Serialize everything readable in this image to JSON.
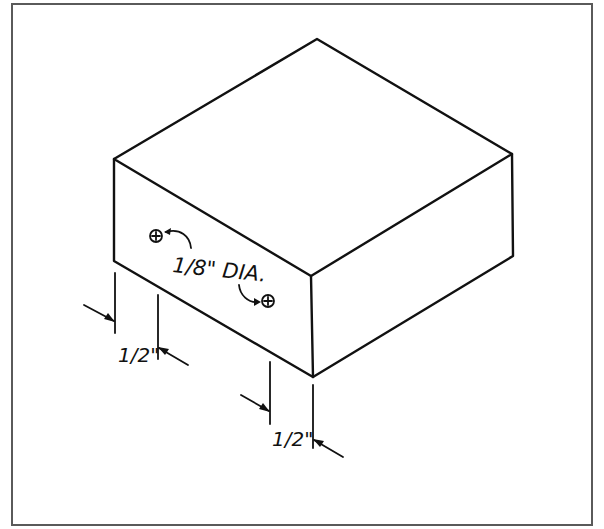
{
  "figure": {
    "type": "isometric-block-drawing",
    "frame_color": "#5a5a5a",
    "line_color": "#111111"
  },
  "annotations": {
    "hole_note": "1/8\" DIA.",
    "hole_note_fraction": "1/8\"",
    "hole_note_suffix": "DIA.",
    "left_dimension": "1/2\"",
    "right_dimension": "1/2\""
  },
  "holes": [
    {
      "name": "hole-left",
      "cx": 156,
      "cy": 236
    },
    {
      "name": "hole-right",
      "cx": 268,
      "cy": 301
    }
  ]
}
